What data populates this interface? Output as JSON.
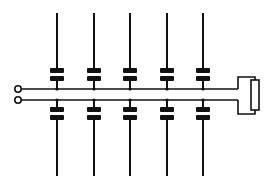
{
  "diagram": {
    "title": "",
    "type": "schematic",
    "colors": {
      "line": "#111111",
      "background": "#ffffff"
    },
    "terminals": [
      {
        "x": 18,
        "y": 89
      },
      {
        "x": 18,
        "y": 100
      }
    ],
    "bus": {
      "top_y": 89,
      "bottom_y": 100,
      "x_start": 22,
      "x_end": 238
    },
    "conductors": [
      {
        "x": 57
      },
      {
        "x": 94
      },
      {
        "x": 130
      },
      {
        "x": 167
      },
      {
        "x": 203
      }
    ],
    "conductor_y_range": [
      13,
      176
    ],
    "load": {
      "kind": "resistor",
      "x": 255,
      "y_top": 80,
      "y_bottom": 110
    }
  }
}
